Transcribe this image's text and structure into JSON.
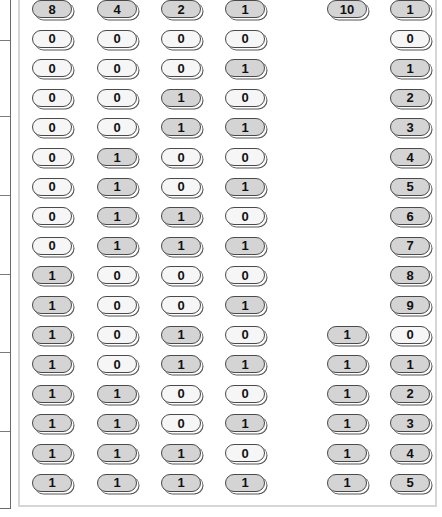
{
  "table": {
    "headers": [
      {
        "label": "8",
        "col": 0
      },
      {
        "label": "4",
        "col": 1
      },
      {
        "label": "2",
        "col": 2
      },
      {
        "label": "1",
        "col": 3
      },
      {
        "label": "10",
        "col": 4
      },
      {
        "label": "1",
        "col": 5
      }
    ],
    "rows": [
      {
        "bits": [
          "0",
          "0",
          "0",
          "0"
        ],
        "tens": "",
        "ones": "0"
      },
      {
        "bits": [
          "0",
          "0",
          "0",
          "1"
        ],
        "tens": "",
        "ones": "1"
      },
      {
        "bits": [
          "0",
          "0",
          "1",
          "0"
        ],
        "tens": "",
        "ones": "2"
      },
      {
        "bits": [
          "0",
          "0",
          "1",
          "1"
        ],
        "tens": "",
        "ones": "3"
      },
      {
        "bits": [
          "0",
          "1",
          "0",
          "0"
        ],
        "tens": "",
        "ones": "4"
      },
      {
        "bits": [
          "0",
          "1",
          "0",
          "1"
        ],
        "tens": "",
        "ones": "5"
      },
      {
        "bits": [
          "0",
          "1",
          "1",
          "0"
        ],
        "tens": "",
        "ones": "6"
      },
      {
        "bits": [
          "0",
          "1",
          "1",
          "1"
        ],
        "tens": "",
        "ones": "7"
      },
      {
        "bits": [
          "1",
          "0",
          "0",
          "0"
        ],
        "tens": "",
        "ones": "8"
      },
      {
        "bits": [
          "1",
          "0",
          "0",
          "1"
        ],
        "tens": "",
        "ones": "9"
      },
      {
        "bits": [
          "1",
          "0",
          "1",
          "0"
        ],
        "tens": "1",
        "ones": "0"
      },
      {
        "bits": [
          "1",
          "0",
          "1",
          "1"
        ],
        "tens": "1",
        "ones": "1"
      },
      {
        "bits": [
          "1",
          "1",
          "0",
          "0"
        ],
        "tens": "1",
        "ones": "2"
      },
      {
        "bits": [
          "1",
          "1",
          "0",
          "1"
        ],
        "tens": "1",
        "ones": "3"
      },
      {
        "bits": [
          "1",
          "1",
          "1",
          "0"
        ],
        "tens": "1",
        "ones": "4"
      },
      {
        "bits": [
          "1",
          "1",
          "1",
          "1"
        ],
        "tens": "1",
        "ones": "5"
      }
    ]
  },
  "colors": {
    "pill_on": "#d4d4d4",
    "pill_off": "#f6f6f6",
    "pill_border": "#4a4a4a",
    "panel_border": "#d6d6d6"
  }
}
